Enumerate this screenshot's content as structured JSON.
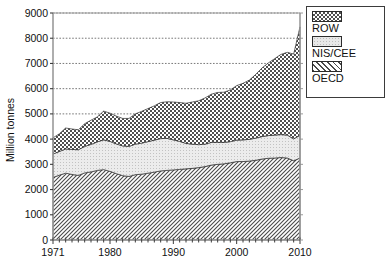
{
  "chart_data": {
    "type": "area",
    "title": "",
    "xlabel": "",
    "ylabel": "Million tonnes",
    "xlim": [
      1971,
      2010
    ],
    "ylim": [
      0,
      9000
    ],
    "grid": true,
    "stacked": true,
    "legend_position": "right",
    "ytick_labels": [
      "0",
      "1000",
      "2000",
      "3000",
      "4000",
      "5000",
      "6000",
      "7000",
      "8000",
      "9000"
    ],
    "ytick_values": [
      0,
      1000,
      2000,
      3000,
      4000,
      5000,
      6000,
      7000,
      8000,
      9000
    ],
    "xtick_labels": [
      "1971",
      "1980",
      "1990",
      "2000",
      "2010"
    ],
    "xtick_values": [
      1971,
      1980,
      1990,
      2000,
      2010
    ],
    "x": [
      1971,
      1972,
      1973,
      1974,
      1975,
      1976,
      1977,
      1978,
      1979,
      1980,
      1981,
      1982,
      1983,
      1984,
      1985,
      1986,
      1987,
      1988,
      1989,
      1990,
      1991,
      1992,
      1993,
      1994,
      1995,
      1996,
      1997,
      1998,
      1999,
      2000,
      2001,
      2002,
      2003,
      2004,
      2005,
      2006,
      2007,
      2008,
      2009,
      2010
    ],
    "series": [
      {
        "name": "OECD",
        "pattern": "diagonal-hatch",
        "color": "#8c8c8c",
        "values": [
          2480,
          2570,
          2650,
          2600,
          2560,
          2660,
          2700,
          2760,
          2790,
          2720,
          2630,
          2550,
          2520,
          2590,
          2610,
          2650,
          2690,
          2740,
          2760,
          2780,
          2800,
          2820,
          2840,
          2870,
          2910,
          2970,
          3000,
          3020,
          3060,
          3110,
          3110,
          3130,
          3160,
          3210,
          3240,
          3250,
          3270,
          3250,
          3140,
          3250
        ]
      },
      {
        "name": "NIS/CEE",
        "pattern": "stipple-light",
        "color": "#d8d8d8",
        "values": [
          930,
          940,
          960,
          990,
          1020,
          1050,
          1090,
          1130,
          1180,
          1190,
          1180,
          1180,
          1190,
          1210,
          1230,
          1250,
          1270,
          1280,
          1270,
          1190,
          1110,
          1010,
          960,
          910,
          890,
          900,
          870,
          850,
          840,
          850,
          860,
          860,
          880,
          890,
          900,
          910,
          910,
          910,
          870,
          900
        ]
      },
      {
        "name": "ROW",
        "pattern": "checkerboard-dark",
        "color": "#5e5e5e",
        "values": [
          640,
          700,
          830,
          810,
          790,
          900,
          960,
          990,
          1140,
          1120,
          1100,
          1090,
          1110,
          1200,
          1260,
          1310,
          1360,
          1430,
          1450,
          1500,
          1540,
          1590,
          1670,
          1740,
          1830,
          1910,
          1980,
          1990,
          2050,
          2160,
          2240,
          2350,
          2520,
          2720,
          2880,
          3030,
          3180,
          3280,
          3360,
          4300
        ]
      }
    ],
    "series_totals_note": "",
    "totals": [
      4050,
      4210,
      4440,
      4400,
      4370,
      4610,
      4750,
      4880,
      5110,
      5030,
      4910,
      4820,
      4820,
      5000,
      5100,
      5210,
      5320,
      5450,
      5480,
      5470,
      5450,
      5420,
      5470,
      5520,
      5630,
      5780,
      5850,
      5860,
      5950,
      6120,
      6210,
      6340,
      6560,
      6820,
      7020,
      7190,
      7360,
      7440,
      7370,
      8450
    ]
  },
  "legend": {
    "items": [
      {
        "label": "ROW",
        "swatch_name": "legend-swatch-row"
      },
      {
        "label": "NIS/CEE",
        "swatch_name": "legend-swatch-nis-cee"
      },
      {
        "label": "OECD",
        "swatch_name": "legend-swatch-oecd"
      }
    ]
  }
}
